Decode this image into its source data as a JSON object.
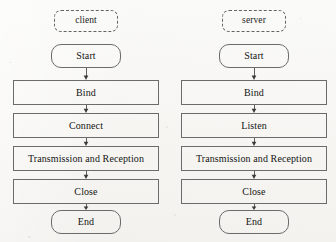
{
  "diagram": {
    "background_color": "#f8f7f5",
    "line_color": "#6b6b6b",
    "text_color": "#141414",
    "columns": [
      {
        "id": "client",
        "header": "client",
        "nodes": [
          {
            "label": "Start",
            "shape": "terminal"
          },
          {
            "label": "Bind",
            "shape": "process"
          },
          {
            "label": "Connect",
            "shape": "process"
          },
          {
            "label": "Transmission and Reception",
            "shape": "process"
          },
          {
            "label": "Close",
            "shape": "process"
          },
          {
            "label": "End",
            "shape": "terminal"
          }
        ],
        "connectors": [
          {
            "from": "Start",
            "to": "Bind",
            "arrow": "down"
          },
          {
            "from": "Bind",
            "to": "Connect",
            "arrow": "down"
          },
          {
            "from": "Connect",
            "to": "Transmission and Reception",
            "arrow": "down"
          },
          {
            "from": "Transmission and Reception",
            "to": "Close",
            "arrow": "down"
          },
          {
            "from": "Close",
            "to": "End",
            "arrow": "down"
          }
        ]
      },
      {
        "id": "server",
        "header": "server",
        "nodes": [
          {
            "label": "Start",
            "shape": "terminal"
          },
          {
            "label": "Bind",
            "shape": "process"
          },
          {
            "label": "Listen",
            "shape": "process"
          },
          {
            "label": "Transmission and Reception",
            "shape": "process"
          },
          {
            "label": "Close",
            "shape": "process"
          },
          {
            "label": "End",
            "shape": "terminal"
          }
        ],
        "connectors": [
          {
            "from": "Start",
            "to": "Bind",
            "arrow": "down"
          },
          {
            "from": "Bind",
            "to": "Listen",
            "arrow": "down"
          },
          {
            "from": "Listen",
            "to": "Transmission and Reception",
            "arrow": "down"
          },
          {
            "from": "Transmission and Reception",
            "to": "Close",
            "arrow": "down"
          },
          {
            "from": "Close",
            "to": "End",
            "arrow": "down"
          }
        ]
      }
    ]
  }
}
